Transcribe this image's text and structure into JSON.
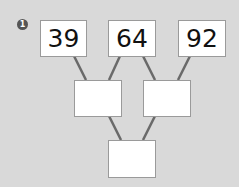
{
  "problem_number": "1",
  "top_row": [
    "39",
    "64",
    "92"
  ],
  "middle_row": [
    "",
    ""
  ],
  "bottom_row": [
    ""
  ],
  "colors": {
    "background": "#d9d9d9",
    "box": "#ffffff",
    "lines": "#666666",
    "badge": "#555555"
  }
}
